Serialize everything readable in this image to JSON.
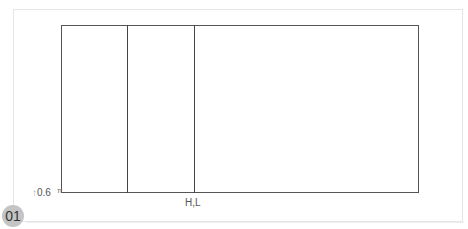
{
  "figure": {
    "badge_number": "01",
    "axis_label": {
      "arrow_icon": "up-arrow",
      "arrow_glyph": "↑",
      "value": "0.6",
      "tick_glyph": "π"
    },
    "bottom_label": "H,L",
    "colors": {
      "line": "#444444",
      "frame": "#e6e6e6",
      "badge_bg": "#c4c4c4",
      "badge_text": "#333333",
      "label": "#555555"
    },
    "rectangle": {
      "x": 61,
      "y": 25,
      "width": 358,
      "height": 168
    },
    "divider_lines_x": [
      127,
      194
    ]
  }
}
